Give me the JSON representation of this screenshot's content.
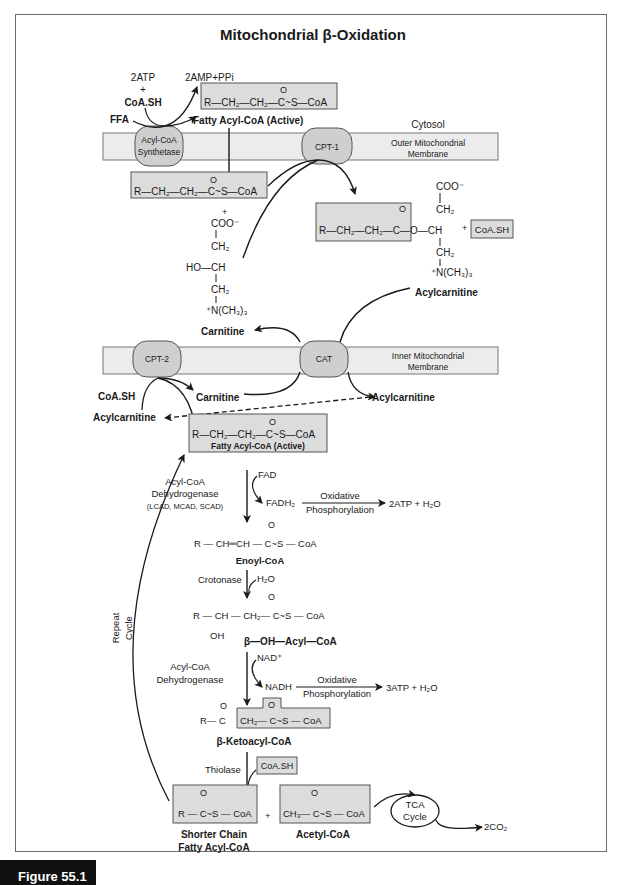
{
  "title": "Mitochondrial β-Oxidation",
  "figure_label": "Figure 55.1",
  "compartments": {
    "cytosol": "Cytosol",
    "outer_membrane": [
      "Outer Mitochondrial",
      "Membrane"
    ],
    "inner_membrane": [
      "Inner Mitochondrial",
      "Membrane"
    ]
  },
  "enzymes": {
    "acyl_coa_synthetase": [
      "Acyl-CoA",
      "Synthetase"
    ],
    "cpt1": "CPT-1",
    "cpt2": "CPT-2",
    "cat": "CAT",
    "acyl_coa_dehydrogenase_1": [
      "Acyl-CoA",
      "Dehydrogenase",
      "(LCAD, MCAD, SCAD)"
    ],
    "crotonase": "Crotonase",
    "acyl_coa_dehydrogenase_2": [
      "Acyl-CoA",
      "Dehydrogenase"
    ],
    "thiolase": "Thiolase"
  },
  "activation": {
    "atp": "2ATP",
    "plus": "+",
    "coash": "CoA.SH",
    "ffa": "FFA",
    "products": "2AMP+PPi"
  },
  "molecules": {
    "fatty_acyl_coa_active": "Fatty Acyl-CoA (Active)",
    "carnitine": "Carnitine",
    "acylcarnitine": "Acylcarnitine",
    "enoyl_coa": "Enoyl-CoA",
    "beta_oh_acyl_coa": "β—OH—Acyl—CoA",
    "beta_ketoacyl_coa": "β-Ketoacyl-CoA",
    "shorter_chain": [
      "Shorter Chain",
      "Fatty Acyl-CoA"
    ],
    "acetyl_coa": "Acetyl-CoA",
    "coash": "CoA.SH"
  },
  "formulas": {
    "acyl_coa": "R—CH₂—CH₂—C~S—CoA",
    "carbonyl_o": "O",
    "coo": "COO⁻",
    "ch2": "CH₂",
    "ho_ch": "HO—CH",
    "n_ch3": "⁺N(CH₃)₃",
    "acylcarnitine_chain": "R—CH₂—CH₂—C—O—CH",
    "enoyl": "R — CH═CH — C~S — CoA",
    "hydroxyacyl": "R — CH — CH₂— C~S — CoA",
    "oh": "OH",
    "ketoacyl_left": "R— C",
    "ketoacyl_right": "CH₂— C~S — CoA",
    "shorter": "R — C~S — CoA",
    "acetyl": "CH₃— C~S — CoA"
  },
  "cofactors": {
    "fad": "FAD",
    "fadh2": "FADH₂",
    "h2o": "H₂O",
    "nad": "NAD⁺",
    "nadh": "NADH",
    "oxidative": "Oxidative",
    "phosphorylation": "Phosphorylation",
    "yield_1": "2ATP + H₂O",
    "yield_2": "3ATP + H₂O",
    "tca": [
      "TCA",
      "Cycle"
    ],
    "co2": "2CO₂"
  },
  "repeat_cycle": [
    "Repeat",
    "Cycle"
  ],
  "colors": {
    "box_fill": "#dcdcdc",
    "membrane_fill": "#ececec",
    "enzyme_fill": "#cfcfcf",
    "line": "#1a1a1a",
    "frame": "#6a6a6a"
  }
}
